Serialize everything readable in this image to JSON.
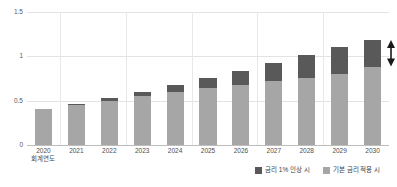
{
  "chart_data": {
    "type": "bar",
    "subtype": "stacked-column",
    "title": "",
    "xlabel": "회계연도",
    "ylabel": "",
    "categories": [
      "2020",
      "2021",
      "2022",
      "2023",
      "2024",
      "2025",
      "2026",
      "2027",
      "2028",
      "2029",
      "2030"
    ],
    "series": [
      {
        "name": "기본 금리 적용 시",
        "color": "#a6a6a6",
        "values": [
          0.41,
          0.45,
          0.5,
          0.55,
          0.6,
          0.64,
          0.68,
          0.72,
          0.76,
          0.8,
          0.88
        ]
      },
      {
        "name": "금리 1% 인상 시",
        "color": "#595959",
        "values": [
          0.0,
          0.01,
          0.03,
          0.05,
          0.08,
          0.12,
          0.16,
          0.21,
          0.26,
          0.3,
          0.3
        ]
      }
    ],
    "totals": [
      0.41,
      0.46,
      0.53,
      0.6,
      0.68,
      0.76,
      0.84,
      0.93,
      1.02,
      1.1,
      1.18
    ],
    "ylim": [
      0,
      1.5
    ],
    "yticks": [
      "0",
      "0.5",
      "1",
      "1.5"
    ],
    "ytick_values": [
      0,
      0.5,
      1,
      1.5
    ],
    "grid": "horizontal-and-vertical",
    "legend_position": "bottom-right",
    "annotations": [
      {
        "name": "range-arrow",
        "type": "double-headed-vertical-arrow",
        "color": "#1a1a1a",
        "target_category": "2030",
        "from_value": 0.88,
        "to_value": 1.18
      }
    ]
  },
  "axis": {
    "y_ticks": [
      {
        "label": "1.5",
        "value": 1.5
      },
      {
        "label": "1",
        "value": 1
      },
      {
        "label": "0.5",
        "value": 0.5
      },
      {
        "label": "0",
        "value": 0
      }
    ],
    "x_ticks": [
      {
        "label": "2020",
        "sub": "회계연도"
      },
      {
        "label": "2021",
        "sub": ""
      },
      {
        "label": "2022",
        "sub": ""
      },
      {
        "label": "2023",
        "sub": ""
      },
      {
        "label": "2024",
        "sub": ""
      },
      {
        "label": "2025",
        "sub": ""
      },
      {
        "label": "2026",
        "sub": ""
      },
      {
        "label": "2027",
        "sub": ""
      },
      {
        "label": "2028",
        "sub": ""
      },
      {
        "label": "2029",
        "sub": ""
      },
      {
        "label": "2030",
        "sub": ""
      }
    ]
  },
  "legend": {
    "items": [
      {
        "label": "금리 1% 인상 시",
        "color": "#595959"
      },
      {
        "label": "기본 금리 적용 시",
        "color": "#a6a6a6"
      }
    ]
  },
  "colors": {
    "series_base": "#a6a6a6",
    "series_hike": "#595959",
    "gridline": "#e3e3e3",
    "axis": "#bdbdbd",
    "annotation": "#1a1a1a",
    "background": "#ffffff"
  }
}
